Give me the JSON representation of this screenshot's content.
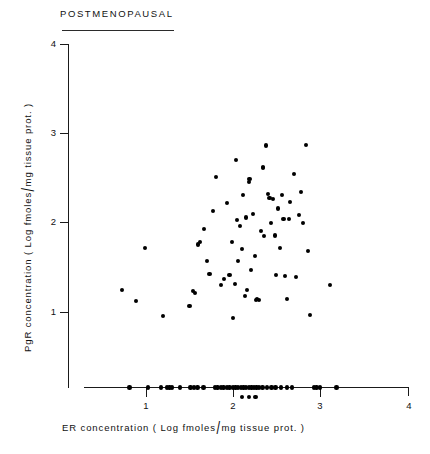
{
  "figure": {
    "title": "POSTMENOPAUSAL",
    "width": 430,
    "height": 454,
    "ink_color": "#000000"
  },
  "axes": {
    "y": {
      "label_parts": {
        "pre": "PgR   concentration   ( Log fmoles",
        "slash": "/",
        "post": "mg  tissue  prot. )"
      },
      "label_full": "PgR concentration ( Log fmoles/ mg tissue prot. )",
      "ticks": [
        "1",
        "2",
        "3",
        "4"
      ],
      "range": [
        0.5,
        4.0
      ]
    },
    "x": {
      "label_parts": {
        "pre": "ER   concentration   ( Log  fmoles",
        "slash": "/",
        "post": "mg  tissue  prot. )"
      },
      "label_full": "ER concentration ( Log fmoles/ mg tissue prot. )",
      "ticks": [
        "1",
        "2",
        "3",
        "4"
      ],
      "range": [
        0.72,
        4.0
      ]
    }
  },
  "chart_data": {
    "type": "scatter",
    "title": "POSTMENOPAUSAL",
    "xlabel": "ER concentration ( Log fmoles/ mg tissue prot. )",
    "ylabel": "PgR concentration ( Log fmoles/ mg tissue prot. )",
    "xlim": [
      0.72,
      4.0
    ],
    "ylim": [
      0.5,
      4.0
    ],
    "xticks": [
      1,
      2,
      3,
      4
    ],
    "yticks": [
      1,
      2,
      3,
      4
    ],
    "grid": false,
    "legend": null,
    "marker": "filled-circle",
    "n_points": 66,
    "series": [
      {
        "name": "postmenopausal patients",
        "points": [
          [
            0.72,
            1.24
          ],
          [
            0.99,
            1.71
          ],
          [
            0.89,
            1.12
          ],
          [
            1.2,
            0.96
          ],
          [
            1.5,
            1.07
          ],
          [
            1.54,
            1.23
          ],
          [
            1.56,
            1.21
          ],
          [
            1.6,
            1.75
          ],
          [
            1.62,
            1.78
          ],
          [
            1.67,
            1.92
          ],
          [
            1.7,
            1.57
          ],
          [
            1.73,
            1.42
          ],
          [
            1.77,
            2.12
          ],
          [
            1.8,
            2.5
          ],
          [
            1.86,
            1.3
          ],
          [
            1.9,
            1.37
          ],
          [
            1.93,
            2.21
          ],
          [
            1.96,
            1.41
          ],
          [
            1.99,
            1.78
          ],
          [
            2.0,
            0.93
          ],
          [
            2.02,
            1.31
          ],
          [
            2.03,
            2.69
          ],
          [
            2.05,
            2.02
          ],
          [
            2.06,
            1.57
          ],
          [
            2.08,
            1.96
          ],
          [
            2.1,
            1.7
          ],
          [
            2.12,
            2.3
          ],
          [
            2.14,
            1.18
          ],
          [
            2.15,
            2.05
          ],
          [
            2.16,
            1.24
          ],
          [
            2.18,
            2.44
          ],
          [
            2.19,
            2.48
          ],
          [
            2.21,
            1.47
          ],
          [
            2.23,
            2.09
          ],
          [
            2.25,
            1.62
          ],
          [
            2.26,
            1.13
          ],
          [
            2.28,
            1.14
          ],
          [
            2.3,
            1.13
          ],
          [
            2.32,
            1.9
          ],
          [
            2.34,
            2.61
          ],
          [
            2.35,
            2.6
          ],
          [
            2.36,
            1.84
          ],
          [
            2.38,
            2.85
          ],
          [
            2.4,
            2.31
          ],
          [
            2.42,
            2.27
          ],
          [
            2.44,
            1.99
          ],
          [
            2.46,
            2.26
          ],
          [
            2.48,
            1.85
          ],
          [
            2.49,
            1.41
          ],
          [
            2.52,
            2.15
          ],
          [
            2.54,
            1.71
          ],
          [
            2.56,
            2.3
          ],
          [
            2.58,
            2.03
          ],
          [
            2.6,
            1.4
          ],
          [
            2.62,
            1.14
          ],
          [
            2.64,
            2.03
          ],
          [
            2.66,
            2.22
          ],
          [
            2.7,
            2.53
          ],
          [
            2.72,
            1.39
          ],
          [
            2.76,
            2.08
          ],
          [
            2.78,
            2.33
          ],
          [
            2.8,
            1.99
          ],
          [
            2.84,
            2.86
          ],
          [
            2.86,
            1.68
          ],
          [
            2.88,
            0.97
          ],
          [
            3.11,
            1.3
          ]
        ]
      }
    ],
    "rug_x": {
      "description": "marginal rug of ER values drawn on the x-axis; overflow values drawn on a second row below the axis",
      "row1": [
        0.81,
        1.02,
        1.17,
        1.24,
        1.27,
        1.3,
        1.39,
        1.51,
        1.55,
        1.59,
        1.66,
        1.79,
        1.82,
        1.86,
        1.89,
        1.93,
        1.96,
        2.0,
        2.03,
        2.06,
        2.09,
        2.12,
        2.15,
        2.18,
        2.21,
        2.24,
        2.27,
        2.3,
        2.34,
        2.39,
        2.44,
        2.49,
        2.55,
        2.62,
        2.68,
        2.93,
        2.96,
        3.0,
        3.19
      ],
      "row2": [
        2.1,
        2.18,
        2.26
      ]
    }
  }
}
